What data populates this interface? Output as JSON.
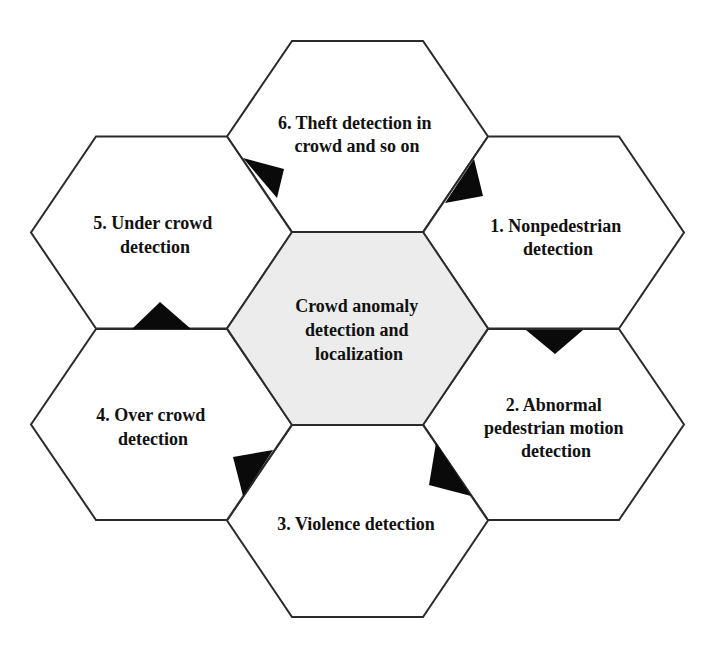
{
  "diagram": {
    "center": {
      "lines": [
        "Crowd anomaly",
        "detection and",
        "localization"
      ],
      "fill": "#ececec"
    },
    "nodes": [
      {
        "id": 1,
        "lines": [
          "1. Nonpedestrian",
          "detection"
        ]
      },
      {
        "id": 2,
        "lines": [
          "2. Abnormal",
          "pedestrian motion",
          "detection"
        ]
      },
      {
        "id": 3,
        "lines": [
          "3. Violence detection"
        ]
      },
      {
        "id": 4,
        "lines": [
          "4. Over crowd",
          "detection"
        ]
      },
      {
        "id": 5,
        "lines": [
          "5. Under crowd",
          "detection"
        ]
      },
      {
        "id": 6,
        "lines": [
          "6. Theft detection in",
          "crowd and so on"
        ]
      }
    ],
    "colors": {
      "stroke": "#2b2b2b",
      "outer_fill": "#ffffff",
      "marker": "#0a0a0a",
      "text": "#111111"
    }
  }
}
